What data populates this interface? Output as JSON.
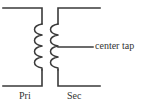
{
  "figure": {
    "type": "schematic-diagram",
    "background_color": "#ffffff",
    "line_color": "#3a3a3a",
    "text_color": "#333333",
    "width": 141,
    "height": 110
  },
  "labels": {
    "primary": "Pri",
    "secondary": "Sec",
    "center_tap": "center tap"
  },
  "components": {
    "primary_coil": {
      "name": "Pri",
      "turns": 4,
      "bulge_direction": "left",
      "x": 42,
      "top_y": 24,
      "bottom_y": 70
    },
    "secondary_coil": {
      "name": "Sec",
      "turns": 4,
      "bulge_direction": "left",
      "x": 58,
      "top_y": 24,
      "bottom_y": 70
    },
    "primary_top_lead": {
      "from_x": 3,
      "to_x": 42,
      "y": 8
    },
    "primary_bottom_lead": {
      "from_x": 3,
      "to_x": 42,
      "y": 86
    },
    "secondary_top_lead": {
      "from_x": 58,
      "to_x": 100,
      "y": 8
    },
    "secondary_bottom_lead": {
      "from_x": 58,
      "to_x": 100,
      "y": 86
    },
    "center_tap_lead": {
      "from_x": 58,
      "to_x": 93,
      "y": 47
    }
  }
}
